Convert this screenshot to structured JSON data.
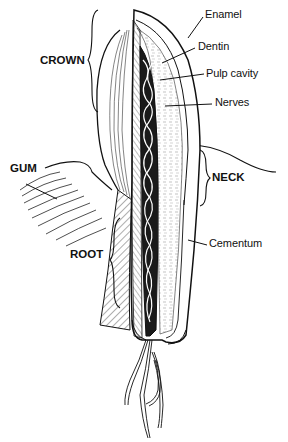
{
  "diagram": {
    "type": "anatomical-illustration",
    "region_labels": [
      {
        "id": "crown",
        "text": "CROWN"
      },
      {
        "id": "gum",
        "text": "GUM"
      },
      {
        "id": "neck",
        "text": "NECK"
      },
      {
        "id": "root",
        "text": "ROOT"
      }
    ],
    "part_labels": [
      {
        "id": "enamel",
        "text": "Enamel"
      },
      {
        "id": "dentin",
        "text": "Dentin"
      },
      {
        "id": "pulp",
        "text": "Pulp  cavity"
      },
      {
        "id": "nerves",
        "text": "Nerves"
      },
      {
        "id": "cementum",
        "text": "Cementum"
      }
    ],
    "colors": {
      "ink": "#111111",
      "background": "#ffffff"
    }
  }
}
